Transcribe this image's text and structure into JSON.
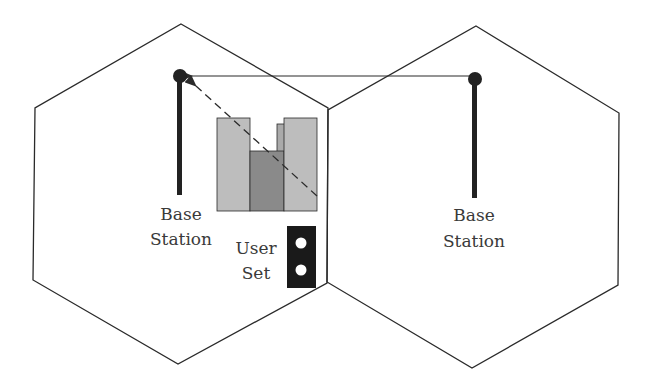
{
  "diagram": {
    "type": "cellular-interference",
    "cells": [
      {
        "id": "left-cell",
        "station_label": [
          "Base",
          "Station"
        ]
      },
      {
        "id": "right-cell",
        "station_label": [
          "Base",
          "Station"
        ]
      }
    ],
    "user": {
      "label": [
        "User",
        "Set"
      ]
    },
    "signals": [
      {
        "from": "right-base-station",
        "to": "left-base-station",
        "style": "solid"
      },
      {
        "from": "user-set",
        "to": "left-base-station",
        "style": "dashed"
      }
    ],
    "colors": {
      "line": "#2a2a2a",
      "building_light": "#bdbdbd",
      "building_dark": "#8a8a8a",
      "phone": "#1a1a1a"
    }
  },
  "labels": {
    "left_bs_line1": "Base",
    "left_bs_line2": "Station",
    "right_bs_line1": "Base",
    "right_bs_line2": "Station",
    "user_line1": "User",
    "user_line2": "Set"
  }
}
